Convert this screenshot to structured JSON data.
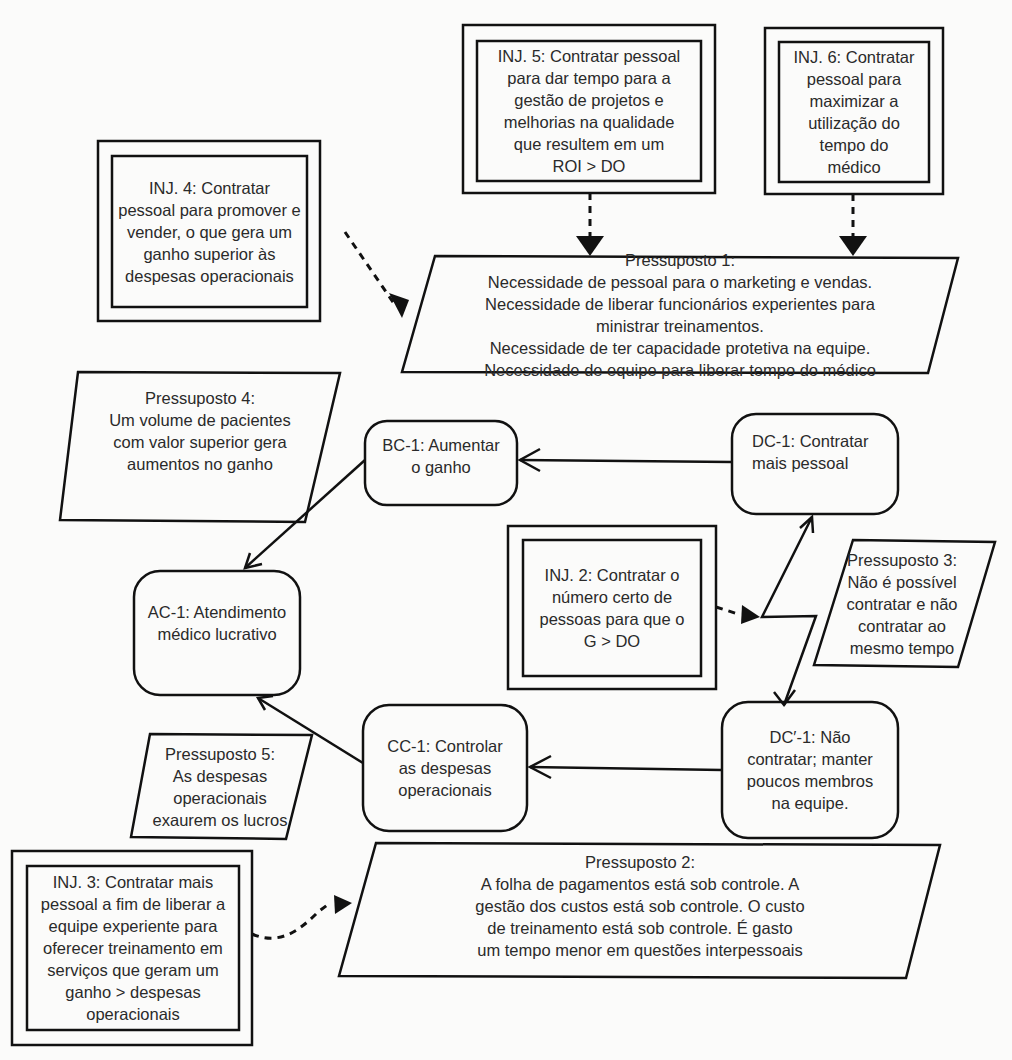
{
  "diagram": {
    "type": "evaporating-cloud",
    "colors": {
      "line": "#111111",
      "text": "#2a2a2a",
      "background": "#fbfbfa"
    }
  },
  "injections": [
    {
      "id": "inj5",
      "text": "INJ. 5: Contratar pessoal\npara dar tempo para a\ngestão de projetos e\nmelhorias na qualidade\nque resultem em um\nROI > DO"
    },
    {
      "id": "inj6",
      "text": "INJ. 6: Contratar\npessoal para\nmaximizar a\nutilização do\ntempo do\nmédico"
    },
    {
      "id": "inj4",
      "text": "INJ. 4: Contratar\npessoal para promover e\nvender, o que gera um\nganho superior às\ndespesas operacionais"
    },
    {
      "id": "inj2",
      "text": "INJ. 2: Contratar o\nnúmero certo de\npessoas para que o\nG > DO"
    },
    {
      "id": "inj3",
      "text": "INJ. 3: Contratar mais\npessoal a fim de liberar a\nequipe experiente para\noferecer treinamento em\nserviços que geram um\nganho > despesas\noperacionais"
    }
  ],
  "assumptions": [
    {
      "id": "p1",
      "text": "Pressuposto 1:\nNecessidade de pessoal para o marketing e vendas.\nNecessidade de liberar funcionários experientes para\nministrar treinamentos.\nNecessidade de ter capacidade protetiva na equipe.\nNecessidade de equipe para liberar tempo do médico"
    },
    {
      "id": "p4",
      "text": "Pressuposto 4:\nUm volume de pacientes\ncom valor superior gera\naumentos no ganho"
    },
    {
      "id": "p3",
      "text": "Pressuposto 3:\nNão é possível\ncontratar e não\ncontratar ao\nmesmo tempo"
    },
    {
      "id": "p5",
      "text": "Pressuposto 5:\nAs despesas\noperacionais\nexaurem os lucros"
    },
    {
      "id": "p2",
      "text": "Pressuposto 2:\nA folha de pagamentos está sob controle. A\ngestão dos custos está sob controle. O custo\nde treinamento está sob controle. É gasto\num tempo menor em questões interpessoais"
    }
  ],
  "entities": [
    {
      "id": "bc1",
      "text": "BC-1: Aumentar\no ganho"
    },
    {
      "id": "dc1",
      "text": "DC-1: Contratar\nmais pessoal"
    },
    {
      "id": "ac1",
      "text": "AC-1: Atendimento\nmédico lucrativo"
    },
    {
      "id": "cc1",
      "text": "CC-1: Controlar\nas despesas\noperacionais"
    },
    {
      "id": "dcp1",
      "text": "DC′-1: Não\ncontratar; manter\npoucos membros\nna equipe."
    }
  ]
}
